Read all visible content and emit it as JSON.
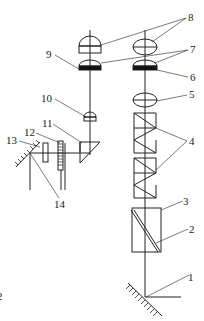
{
  "diagram": {
    "type": "optical-schematic",
    "labels": [
      {
        "id": "1",
        "text": "1",
        "x": 193,
        "y": 278
      },
      {
        "id": "2",
        "text": "2",
        "x": 192,
        "y": 233
      },
      {
        "id": "3",
        "text": "3",
        "x": 186,
        "y": 204
      },
      {
        "id": "4",
        "text": "4",
        "x": 191,
        "y": 145
      },
      {
        "id": "5",
        "text": "5",
        "x": 191,
        "y": 98
      },
      {
        "id": "6",
        "text": "6",
        "x": 193,
        "y": 80
      },
      {
        "id": "7",
        "text": "7",
        "x": 193,
        "y": 52
      },
      {
        "id": "8",
        "text": "8",
        "x": 191,
        "y": 20
      },
      {
        "id": "9",
        "text": "9",
        "x": 48,
        "y": 57
      },
      {
        "id": "10",
        "text": "10",
        "x": 43,
        "y": 101
      },
      {
        "id": "11",
        "text": "11",
        "x": 42,
        "y": 126
      },
      {
        "id": "12",
        "text": "12",
        "x": 24,
        "y": 134
      },
      {
        "id": "13",
        "text": "13",
        "x": 6,
        "y": 143
      },
      {
        "id": "14",
        "text": "14",
        "x": 56,
        "y": 206
      },
      {
        "id": "edge-2",
        "text": "2",
        "x": -2,
        "y": 299
      }
    ]
  }
}
